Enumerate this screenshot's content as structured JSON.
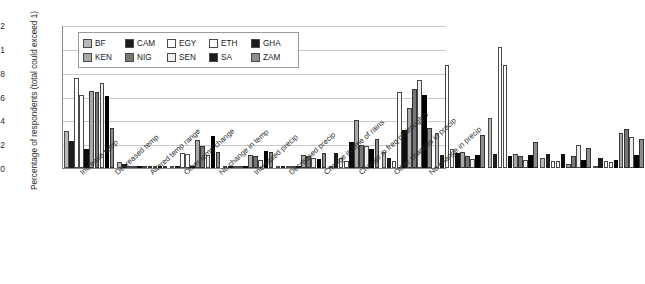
{
  "chart_data": {
    "type": "bar",
    "title": "",
    "xlabel": "",
    "ylabel": "Percentage of respondents (total could exceed 1)",
    "ylim": [
      0,
      1.2
    ],
    "yticks": [
      "0",
      "0.2",
      "0.4",
      "0.6",
      "0.8",
      "1",
      "1.2"
    ],
    "grid": true,
    "legend_position": "top-left inside plot",
    "categories": [
      "Increase temp",
      "Decreased temp",
      "Altered temp range",
      "Other temp change",
      "No change in temp",
      "Increased precip",
      "Decreased precip",
      "Change in time of rains",
      "Change in freq of droughts",
      "Other changes in precip",
      "No change in precip"
    ],
    "series": [
      {
        "name": "BF",
        "values": [
          0.29,
          0.03,
          0.0,
          0.0,
          0.0,
          0.0,
          0.12,
          0.28,
          0.4,
          0.07,
          0.0
        ]
      },
      {
        "name": "CAM",
        "values": [
          0.21,
          0.02,
          0.0,
          0.0,
          0.0,
          0.11,
          0.07,
          0.09,
          0.1,
          0.1,
          0.07
        ]
      },
      {
        "name": "EGY",
        "values": [
          0.74,
          0.0,
          0.11,
          0.0,
          0.0,
          0.07,
          0.04,
          0.85,
          1.0,
          0.04,
          0.04
        ]
      },
      {
        "name": "ETH",
        "values": [
          0.6,
          0.0,
          0.1,
          0.0,
          0.0,
          0.04,
          0.62,
          0.14,
          0.85,
          0.04,
          0.03
        ]
      },
      {
        "name": "GHA",
        "values": [
          0.14,
          0.0,
          0.0,
          0.0,
          0.0,
          0.2,
          0.3,
          0.11,
          0.08,
          0.1,
          0.05
        ]
      },
      {
        "name": "KEN",
        "values": [
          0.63,
          0.0,
          0.22,
          0.09,
          0.09,
          0.39,
          0.49,
          0.12,
          0.1,
          0.02,
          0.28
        ]
      },
      {
        "name": "NIG",
        "values": [
          0.62,
          0.0,
          0.17,
          0.08,
          0.08,
          0.18,
          0.65,
          0.08,
          0.08,
          0.08,
          0.31
        ]
      },
      {
        "name": "SEN",
        "values": [
          0.7,
          0.0,
          0.09,
          0.05,
          0.07,
          0.17,
          0.72,
          0.06,
          0.05,
          0.18,
          0.24
        ]
      },
      {
        "name": "SA",
        "values": [
          0.59,
          0.0,
          0.25,
          0.13,
          0.06,
          0.14,
          0.6,
          0.09,
          0.09,
          0.05,
          0.09
        ]
      },
      {
        "name": "ZAM",
        "values": [
          0.32,
          0.0,
          0.12,
          0.12,
          0.11,
          0.23,
          0.32,
          0.26,
          0.2,
          0.15,
          0.23
        ]
      }
    ]
  },
  "legend": {
    "rows": [
      [
        {
          "label": "BF",
          "swatch": "light-gray"
        },
        {
          "label": "CAM",
          "swatch": "black"
        },
        {
          "label": "EGY",
          "swatch": "white"
        },
        {
          "label": "ETH",
          "swatch": "white"
        },
        {
          "label": "GHA",
          "swatch": "black"
        }
      ],
      [
        {
          "label": "KEN",
          "swatch": "gray"
        },
        {
          "label": "NIG",
          "swatch": "dark-gray"
        },
        {
          "label": "SEN",
          "swatch": "near-white"
        },
        {
          "label": "SA",
          "swatch": "black"
        },
        {
          "label": "ZAM",
          "swatch": "mid-gray"
        }
      ]
    ]
  },
  "colors": {
    "gridline": "#c9c9c9",
    "axis": "#8a8a8a",
    "text": "#2b2b2b",
    "background": "#ffffff"
  }
}
